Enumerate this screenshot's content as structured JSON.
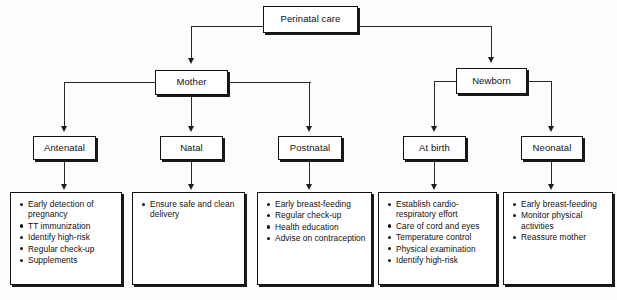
{
  "diagram": {
    "title": "Perinatal care",
    "root": {
      "label": "Perinatal care"
    },
    "branches": [
      {
        "label": "Mother"
      },
      {
        "label": "Newborn"
      }
    ],
    "categories": [
      {
        "label": "Antenatal"
      },
      {
        "label": "Natal"
      },
      {
        "label": "Postnatal"
      },
      {
        "label": "At birth"
      },
      {
        "label": "Neonatal"
      }
    ],
    "details": [
      {
        "parent": "Antenatal",
        "items": [
          "Early detection of pregnancy",
          "TT immunization",
          "Identify high-risk",
          "Regular check-up",
          "Supplements"
        ]
      },
      {
        "parent": "Natal",
        "items": [
          "Ensure safe and clean delivery"
        ]
      },
      {
        "parent": "Postnatal",
        "items": [
          "Early breast-feeding",
          "Regular check-up",
          "Health education",
          "Advise on contraception"
        ]
      },
      {
        "parent": "At birth",
        "items": [
          "Establish cardio-respiratory effort",
          "Care of cord and eyes",
          "Temperature control",
          "Physical examination",
          "Identify high-risk"
        ]
      },
      {
        "parent": "Neonatal",
        "items": [
          "Early breast-feeding",
          "Monitor physical activities",
          "Reassure mother"
        ]
      }
    ],
    "colors": {
      "stroke": "#111111",
      "background": "#ffffff",
      "connector": "#2a2a2a"
    }
  }
}
